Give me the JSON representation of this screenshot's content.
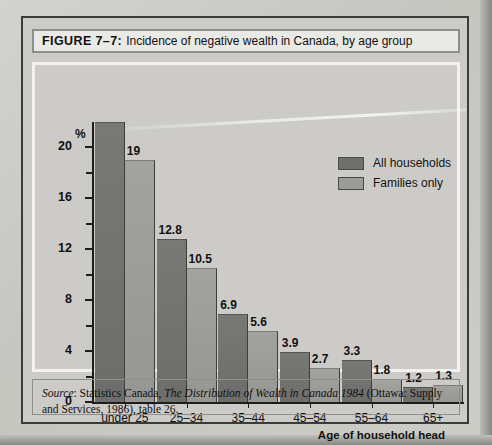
{
  "figure": {
    "number_label": "FIGURE 7–7:",
    "title": "Incidence of negative wealth in Canada, by age group",
    "unit_label": "%",
    "x_axis_title": "Age of household head"
  },
  "legend": {
    "series_1": "All households",
    "series_2": "Families only"
  },
  "source": {
    "prefix": "Source",
    "text_before_italic": ": Statistics Canada, ",
    "italic_title": "The Distribution of Wealth in Canada 1984",
    "text_after_italic": " (Ottawa: Supply and Services, 1986), table 26."
  },
  "colors": {
    "series_1": "#6f6f6d",
    "series_2": "#9b9b97",
    "axis": "#1d1d1b",
    "paper": "#cccbc7",
    "frame": "#3b3b39"
  },
  "chart_data": {
    "type": "bar",
    "title": "Incidence of negative wealth in Canada, by age group",
    "xlabel": "Age of household head",
    "ylabel": "%",
    "ylim": [
      0,
      22
    ],
    "yticks": [
      0,
      4,
      8,
      12,
      16,
      20
    ],
    "ytick_labels": [
      "0",
      "4",
      "8",
      "12",
      "16",
      "20"
    ],
    "minor_ticks": [
      2,
      6,
      10,
      14,
      18
    ],
    "grid": false,
    "legend_position": "top-right",
    "categories": [
      "under 25",
      "25–34",
      "35–44",
      "45–54",
      "55–64",
      "65+"
    ],
    "series": [
      {
        "name": "All households",
        "color": "#6f6f6d",
        "values": [
          22.0,
          12.8,
          6.9,
          3.9,
          3.3,
          1.2
        ],
        "labels": [
          "",
          "12.8",
          "6.9",
          "3.9",
          "3.3",
          "1.2"
        ]
      },
      {
        "name": "Families only",
        "color": "#9b9b97",
        "values": [
          19,
          10.5,
          5.6,
          2.7,
          1.8,
          1.3
        ],
        "labels": [
          "19",
          "10.5",
          "5.6",
          "2.7",
          "1.8",
          "1.3"
        ]
      }
    ]
  }
}
